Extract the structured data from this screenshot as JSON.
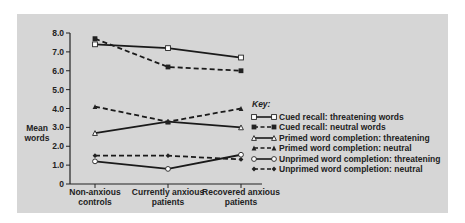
{
  "chart_data": {
    "type": "line",
    "title": "",
    "xlabel": "",
    "ylabel": "Mean words",
    "ylabel_lines": [
      "Mean",
      "words"
    ],
    "ylim": [
      0,
      8.0
    ],
    "yticks": [
      "0",
      "1.0",
      "2.0",
      "3.0",
      "4.0",
      "5.0",
      "6.0",
      "7.0",
      "8.0"
    ],
    "categories": [
      "Non-anxious controls",
      "Currently anxious patients",
      "Recovered anxious patients"
    ],
    "category_lines": [
      [
        "Non-anxious",
        "controls"
      ],
      [
        "Currently anxious",
        "patients"
      ],
      [
        "Recovered anxious",
        "patients"
      ]
    ],
    "grid": false,
    "legend_title": "Key:",
    "legend_position": "right",
    "series": [
      {
        "name": "Cued recall: threatening words",
        "values": [
          7.4,
          7.2,
          6.7
        ],
        "style": "solid",
        "marker": "open-square"
      },
      {
        "name": "Cued recall: neutral words",
        "values": [
          7.7,
          6.2,
          6.0
        ],
        "style": "dashed",
        "marker": "filled-square"
      },
      {
        "name": "Primed word completion: threatening",
        "values": [
          2.7,
          3.3,
          3.0
        ],
        "style": "solid",
        "marker": "open-triangle"
      },
      {
        "name": "Primed word completion: neutral",
        "values": [
          4.1,
          3.3,
          4.0
        ],
        "style": "dashed",
        "marker": "filled-triangle"
      },
      {
        "name": "Unprimed word completion: threatening",
        "values": [
          1.2,
          0.8,
          1.55
        ],
        "style": "solid",
        "marker": "open-circle"
      },
      {
        "name": "Unprimed word completion: neutral",
        "values": [
          1.5,
          1.5,
          1.3
        ],
        "style": "dashed",
        "marker": "filled-diamond"
      }
    ]
  }
}
